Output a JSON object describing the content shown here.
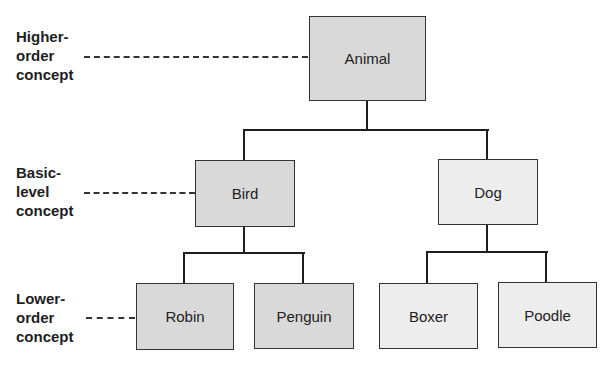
{
  "levels": {
    "higher": "Higher-\norder\nconcept",
    "basic": "Basic-\nlevel\nconcept",
    "lower": "Lower-\norder\nconcept"
  },
  "nodes": {
    "animal": "Animal",
    "bird": "Bird",
    "dog": "Dog",
    "robin": "Robin",
    "penguin": "Penguin",
    "boxer": "Boxer",
    "poodle": "Poodle"
  },
  "colors": {
    "dark_fill": "#d9d9d9",
    "light_fill": "#ededed",
    "line": "#1e1e1e"
  }
}
